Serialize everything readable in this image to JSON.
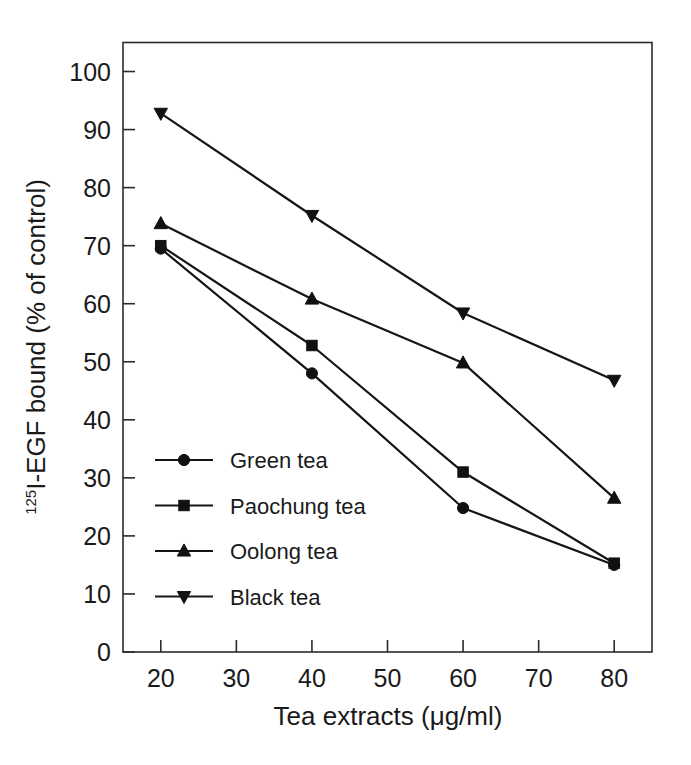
{
  "chart_data": {
    "type": "line",
    "title": "",
    "xlabel": "Tea extracts (μg/ml)",
    "ylabel": "125I-EGF bound (% of control)",
    "ylabel_sup": "125",
    "ylabel_rest": "I-EGF bound (% of control)",
    "x": [
      20,
      40,
      60,
      80
    ],
    "xlim": [
      15,
      85
    ],
    "ylim": [
      0,
      105
    ],
    "xticks": [
      20,
      30,
      40,
      50,
      60,
      70,
      80
    ],
    "xtick_labels": [
      "20",
      "30",
      "40",
      "50",
      "60",
      "70",
      "80"
    ],
    "yticks": [
      0,
      10,
      20,
      30,
      40,
      50,
      60,
      70,
      80,
      90,
      100
    ],
    "ytick_labels": [
      "0",
      "10",
      "20",
      "30",
      "40",
      "50",
      "60",
      "70",
      "80",
      "90",
      "100"
    ],
    "grid": false,
    "legend_position": "lower-left-inside",
    "series": [
      {
        "name": "Green tea",
        "marker": "circle",
        "color": "#111111",
        "values": [
          69.5,
          48.0,
          24.8,
          15.0
        ]
      },
      {
        "name": "Paochung tea",
        "marker": "square",
        "color": "#111111",
        "values": [
          70.0,
          52.8,
          31.0,
          15.3
        ]
      },
      {
        "name": "Oolong tea",
        "marker": "triangle-up",
        "color": "#111111",
        "values": [
          73.8,
          60.8,
          49.8,
          26.5
        ]
      },
      {
        "name": "Black tea",
        "marker": "triangle-down",
        "color": "#111111",
        "values": [
          92.8,
          75.2,
          58.4,
          46.8
        ]
      }
    ]
  },
  "legend": {
    "entries": [
      {
        "label": "Green tea",
        "marker": "circle"
      },
      {
        "label": "Paochung tea",
        "marker": "square"
      },
      {
        "label": "Oolong tea",
        "marker": "triangle-up"
      },
      {
        "label": "Black tea",
        "marker": "triangle-down"
      }
    ]
  }
}
